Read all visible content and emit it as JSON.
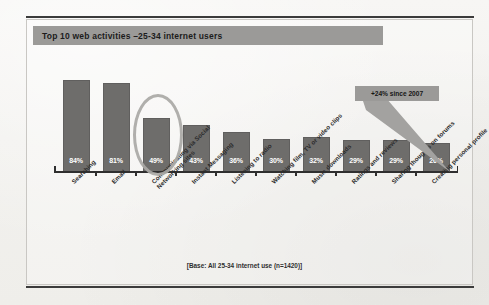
{
  "figure": {
    "title": "Top 10 web activities –25-34 internet users",
    "base_note": "[Base: All 25-34 internet use (n=1420)]",
    "callout": "+24% since 2007",
    "colors": {
      "bar": "#6e6d6b",
      "banner": "#9b9a98",
      "highlight_ring": "#a9a8a5",
      "axis": "#2f2f2f",
      "paper": "#f4f3f1"
    }
  },
  "chart_data": {
    "type": "bar",
    "title": "Top 10 web activities –25-34 internet users",
    "xlabel": "",
    "ylabel": "",
    "ylim": [
      0,
      100
    ],
    "grid": false,
    "legend": "none",
    "value_suffix": "%",
    "categories": [
      "Searching",
      "Email",
      "Communicating via Social Networking sites",
      "Instant Messaging",
      "Listening to radio",
      "Watching film, TV or video clips",
      "Music downloads",
      "Ratings and reviews",
      "Sharing thoughts on forums",
      "Creating personal profile"
    ],
    "category_lines": [
      [
        "Searching"
      ],
      [
        "Email"
      ],
      [
        "Communicating via Social",
        "Networking sites"
      ],
      [
        "Instant Messaging"
      ],
      [
        "Listening to radio"
      ],
      [
        "Watching film, TV or video clips"
      ],
      [
        "Music downloads"
      ],
      [
        "Ratings and reviews"
      ],
      [
        "Sharing thoughts on forums"
      ],
      [
        "Creating personal profile"
      ]
    ],
    "values": [
      84,
      81,
      49,
      43,
      36,
      30,
      32,
      29,
      29,
      26
    ],
    "labels": [
      "84%",
      "81%",
      "49%",
      "43%",
      "36%",
      "30%",
      "32%",
      "29%",
      "29%",
      "26%"
    ],
    "annotations": [
      {
        "text": "+24% since 2007",
        "points_to_category": "Creating personal profile",
        "points_to_value": 26
      },
      {
        "type": "ellipse-highlight",
        "highlights_category": "Communicating via Social Networking sites",
        "highlights_value": 49
      }
    ]
  }
}
